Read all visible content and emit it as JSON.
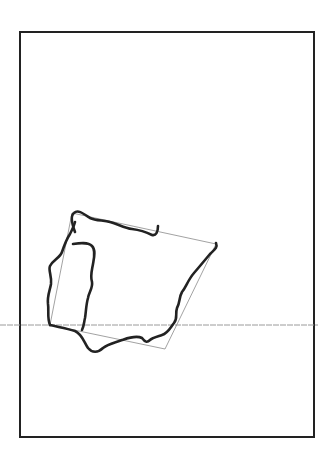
{
  "diagram": {
    "background": "#ffffff",
    "frame": {
      "x": 20,
      "y": 32,
      "width": 294,
      "height": 405,
      "stroke": "#222222",
      "stroke_width": 2
    },
    "horizontal_guide": {
      "x1": 0,
      "x2": 318,
      "y": 325,
      "stroke": "#9a9a9a",
      "stroke_width": 1
    },
    "guide_square": {
      "points": "72,213 216,244 165,349 50,325",
      "stroke": "#8a8a8a",
      "stroke_width": 0.8
    },
    "outline": {
      "stroke": "#222222",
      "stroke_width": 2.6,
      "north_coast": "M75,232 C72,224 70,216 74,213 C78,209 84,214 90,218 C96,221 104,220 110,222 C118,224 124,228 132,229 C140,230 148,233 152,235 C156,236 158,232 158,226",
      "east_coast": "M216,243 C218,248 214,250 210,254 C205,260 200,266 194,273 C188,280 186,287 182,292 C179,297 180,303 177,308 C175,314 178,318 174,323 C170,328 168,333 162,335 C156,337 152,338 150,340 C147,343 145,342 142,338 C136,335 128,338 122,340 C114,343 108,344 103,348 C98,353 92,353 88,348 C84,342 82,334 75,331 C66,328 58,327 50,325",
      "west_coast": "M50,325 C47,318 49,310 48,304 C47,296 50,290 51,284 C52,276 48,270 50,266 C53,260 60,258 62,252 C64,246 66,240 70,234 C72,230 74,226 75,222",
      "portugal_border": "M73,244 C80,243 88,242 92,246 C96,250 94,258 93,264 C92,270 90,276 92,282 C93,288 89,292 88,298 C86,305 86,312 85,318 C84,322 84,326 82,330"
    }
  }
}
